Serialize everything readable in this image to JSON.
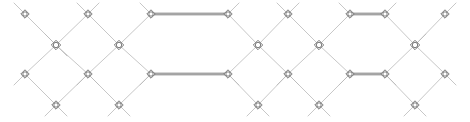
{
  "figure": {
    "title": "",
    "width": 470,
    "height": 122,
    "background_color": "#ffffff"
  },
  "style": {
    "diagonal_edge_color": "#b9b9b9",
    "diagonal_edge_width": 0.8,
    "horizontal_edge_color": "#6e6e6e",
    "horizontal_edge_width": 0.9,
    "horizontal_edge_gap": 1.6,
    "node_stroke_color": "#5a5a5a",
    "node_fill_color": "#ffffff",
    "node_stroke_width": 0.8,
    "small_node_radius": 3.1,
    "large_node_radius": 3.6
  },
  "rows": {
    "y_top": 14,
    "y_upper_mid": 45,
    "y_lower_mid": 74,
    "y_bottom": 105
  },
  "nodes": [
    {
      "id": "t0",
      "label": "",
      "row": "top",
      "x": 25,
      "y": 14,
      "size": "small",
      "shape": "diamond-circle"
    },
    {
      "id": "t1",
      "label": "",
      "row": "top",
      "x": 88,
      "y": 14,
      "size": "small",
      "shape": "diamond-circle"
    },
    {
      "id": "t2",
      "label": "",
      "row": "top",
      "x": 151,
      "y": 14,
      "size": "small",
      "shape": "diamond-circle"
    },
    {
      "id": "t3",
      "label": "",
      "row": "top",
      "x": 228,
      "y": 14,
      "size": "small",
      "shape": "diamond-circle"
    },
    {
      "id": "t4",
      "label": "",
      "row": "top",
      "x": 288,
      "y": 14,
      "size": "small",
      "shape": "diamond-circle"
    },
    {
      "id": "t5",
      "label": "",
      "row": "top",
      "x": 350,
      "y": 14,
      "size": "small",
      "shape": "diamond-circle"
    },
    {
      "id": "t6",
      "label": "",
      "row": "top",
      "x": 385,
      "y": 14,
      "size": "small",
      "shape": "diamond-circle"
    },
    {
      "id": "t7",
      "label": "",
      "row": "top",
      "x": 445,
      "y": 14,
      "size": "small",
      "shape": "diamond-circle"
    },
    {
      "id": "u0",
      "label": "",
      "row": "upper-mid",
      "x": 56,
      "y": 45,
      "size": "large",
      "shape": "diamond-circle"
    },
    {
      "id": "u1",
      "label": "",
      "row": "upper-mid",
      "x": 119,
      "y": 45,
      "size": "large",
      "shape": "diamond-circle"
    },
    {
      "id": "u2",
      "label": "",
      "row": "upper-mid",
      "x": 258,
      "y": 45,
      "size": "large",
      "shape": "diamond-circle"
    },
    {
      "id": "u3",
      "label": "",
      "row": "upper-mid",
      "x": 319,
      "y": 45,
      "size": "large",
      "shape": "diamond-circle"
    },
    {
      "id": "u4",
      "label": "",
      "row": "upper-mid",
      "x": 415,
      "y": 45,
      "size": "large",
      "shape": "diamond-circle"
    },
    {
      "id": "m0",
      "label": "",
      "row": "lower-mid",
      "x": 25,
      "y": 74,
      "size": "small",
      "shape": "diamond-circle"
    },
    {
      "id": "m1",
      "label": "",
      "row": "lower-mid",
      "x": 88,
      "y": 74,
      "size": "small",
      "shape": "diamond-circle"
    },
    {
      "id": "m2",
      "label": "",
      "row": "lower-mid",
      "x": 151,
      "y": 74,
      "size": "small",
      "shape": "diamond-circle"
    },
    {
      "id": "m3",
      "label": "",
      "row": "lower-mid",
      "x": 228,
      "y": 74,
      "size": "small",
      "shape": "diamond-circle"
    },
    {
      "id": "m4",
      "label": "",
      "row": "lower-mid",
      "x": 288,
      "y": 74,
      "size": "small",
      "shape": "diamond-circle"
    },
    {
      "id": "m5",
      "label": "",
      "row": "lower-mid",
      "x": 350,
      "y": 74,
      "size": "small",
      "shape": "diamond-circle"
    },
    {
      "id": "m6",
      "label": "",
      "row": "lower-mid",
      "x": 385,
      "y": 74,
      "size": "small",
      "shape": "diamond-circle"
    },
    {
      "id": "m7",
      "label": "",
      "row": "lower-mid",
      "x": 445,
      "y": 74,
      "size": "small",
      "shape": "diamond-circle"
    },
    {
      "id": "b0",
      "label": "",
      "row": "bottom",
      "x": 56,
      "y": 105,
      "size": "small",
      "shape": "diamond-circle"
    },
    {
      "id": "b1",
      "label": "",
      "row": "bottom",
      "x": 119,
      "y": 105,
      "size": "small",
      "shape": "diamond-circle"
    },
    {
      "id": "b2",
      "label": "",
      "row": "bottom",
      "x": 258,
      "y": 105,
      "size": "small",
      "shape": "diamond-circle"
    },
    {
      "id": "b3",
      "label": "",
      "row": "bottom",
      "x": 319,
      "y": 105,
      "size": "small",
      "shape": "diamond-circle"
    },
    {
      "id": "b4",
      "label": "",
      "row": "bottom",
      "x": 415,
      "y": 105,
      "size": "small",
      "shape": "diamond-circle"
    }
  ],
  "diagonal_edges": [
    {
      "from": "t0",
      "to": "u0"
    },
    {
      "from": "u0",
      "to": "t1"
    },
    {
      "from": "t1",
      "to": "u1"
    },
    {
      "from": "u1",
      "to": "t2"
    },
    {
      "from": "t3",
      "to": "u2"
    },
    {
      "from": "u2",
      "to": "t4"
    },
    {
      "from": "t4",
      "to": "u3"
    },
    {
      "from": "u3",
      "to": "t5"
    },
    {
      "from": "t6",
      "to": "u4"
    },
    {
      "from": "u4",
      "to": "t7"
    },
    {
      "from": "m0",
      "to": "u0"
    },
    {
      "from": "u0",
      "to": "m1"
    },
    {
      "from": "m1",
      "to": "u1"
    },
    {
      "from": "u1",
      "to": "m2"
    },
    {
      "from": "m3",
      "to": "u2"
    },
    {
      "from": "u2",
      "to": "m4"
    },
    {
      "from": "m4",
      "to": "u3"
    },
    {
      "from": "u3",
      "to": "m5"
    },
    {
      "from": "m6",
      "to": "u4"
    },
    {
      "from": "u4",
      "to": "m7"
    },
    {
      "from": "m0",
      "to": "b0"
    },
    {
      "from": "b0",
      "to": "m1"
    },
    {
      "from": "m1",
      "to": "b1"
    },
    {
      "from": "b1",
      "to": "m2"
    },
    {
      "from": "m3",
      "to": "b2"
    },
    {
      "from": "b2",
      "to": "m4"
    },
    {
      "from": "m4",
      "to": "b3"
    },
    {
      "from": "b3",
      "to": "m5"
    },
    {
      "from": "m6",
      "to": "b4"
    },
    {
      "from": "b4",
      "to": "m7"
    }
  ],
  "horizontal_edges": [
    {
      "id": "h-top-long",
      "from": "t2",
      "to": "t3",
      "style": "double"
    },
    {
      "id": "h-mid-long",
      "from": "m2",
      "to": "m3",
      "style": "double"
    },
    {
      "id": "h-top-short",
      "from": "t5",
      "to": "t6",
      "style": "double"
    },
    {
      "id": "h-mid-short",
      "from": "m5",
      "to": "m6",
      "style": "double"
    }
  ],
  "stub_edges": [
    {
      "id": "stub-left-top",
      "x1": 14,
      "y1": 3,
      "x2": 25,
      "y2": 14
    },
    {
      "id": "stub-left-mid",
      "x1": 14,
      "y1": 85,
      "x2": 25,
      "y2": 74
    },
    {
      "id": "stub-t1-left",
      "x1": 77,
      "y1": 3,
      "x2": 88,
      "y2": 14
    },
    {
      "id": "stub-t1-right",
      "x1": 99,
      "y1": 3,
      "x2": 88,
      "y2": 14
    },
    {
      "id": "stub-t2-left",
      "x1": 140,
      "y1": 3,
      "x2": 151,
      "y2": 14
    },
    {
      "id": "stub-t3-right",
      "x1": 239,
      "y1": 3,
      "x2": 228,
      "y2": 14
    },
    {
      "id": "stub-t4-left",
      "x1": 277,
      "y1": 3,
      "x2": 288,
      "y2": 14
    },
    {
      "id": "stub-t4-right",
      "x1": 299,
      "y1": 3,
      "x2": 288,
      "y2": 14
    },
    {
      "id": "stub-t5-left",
      "x1": 339,
      "y1": 3,
      "x2": 350,
      "y2": 14
    },
    {
      "id": "stub-t6-right",
      "x1": 396,
      "y1": 3,
      "x2": 385,
      "y2": 14
    },
    {
      "id": "stub-t7-right",
      "x1": 456,
      "y1": 3,
      "x2": 445,
      "y2": 14
    },
    {
      "id": "stub-m1-left",
      "x1": 77,
      "y1": 85,
      "x2": 88,
      "y2": 74
    },
    {
      "id": "stub-m1-right",
      "x1": 99,
      "y1": 85,
      "x2": 88,
      "y2": 74
    },
    {
      "id": "stub-m2-left",
      "x1": 140,
      "y1": 85,
      "x2": 151,
      "y2": 74
    },
    {
      "id": "stub-m3-right",
      "x1": 239,
      "y1": 85,
      "x2": 228,
      "y2": 74
    },
    {
      "id": "stub-m4-left",
      "x1": 277,
      "y1": 85,
      "x2": 288,
      "y2": 74
    },
    {
      "id": "stub-m4-right",
      "x1": 299,
      "y1": 85,
      "x2": 288,
      "y2": 74
    },
    {
      "id": "stub-m5-left",
      "x1": 339,
      "y1": 85,
      "x2": 350,
      "y2": 74
    },
    {
      "id": "stub-m6-right",
      "x1": 396,
      "y1": 85,
      "x2": 385,
      "y2": 74
    },
    {
      "id": "stub-m7-right",
      "x1": 456,
      "y1": 85,
      "x2": 445,
      "y2": 74
    },
    {
      "id": "stub-b0-left",
      "x1": 45,
      "y1": 116,
      "x2": 56,
      "y2": 105
    },
    {
      "id": "stub-b0-right",
      "x1": 67,
      "y1": 116,
      "x2": 56,
      "y2": 105
    },
    {
      "id": "stub-b1-left",
      "x1": 108,
      "y1": 116,
      "x2": 119,
      "y2": 105
    },
    {
      "id": "stub-b1-right",
      "x1": 130,
      "y1": 116,
      "x2": 119,
      "y2": 105
    },
    {
      "id": "stub-b2-left",
      "x1": 247,
      "y1": 116,
      "x2": 258,
      "y2": 105
    },
    {
      "id": "stub-b2-right",
      "x1": 269,
      "y1": 116,
      "x2": 258,
      "y2": 105
    },
    {
      "id": "stub-b3-left",
      "x1": 308,
      "y1": 116,
      "x2": 319,
      "y2": 105
    },
    {
      "id": "stub-b3-right",
      "x1": 330,
      "y1": 116,
      "x2": 319,
      "y2": 105
    },
    {
      "id": "stub-b4-left",
      "x1": 404,
      "y1": 116,
      "x2": 415,
      "y2": 105
    },
    {
      "id": "stub-b4-right",
      "x1": 426,
      "y1": 116,
      "x2": 415,
      "y2": 105
    },
    {
      "id": "stub-u0-left",
      "x1": 45,
      "y1": 34,
      "x2": 56,
      "y2": 45
    },
    {
      "id": "stub-u0-right",
      "x1": 67,
      "y1": 56,
      "x2": 56,
      "y2": 45
    },
    {
      "id": "stub-u4-right",
      "x1": 426,
      "y1": 34,
      "x2": 415,
      "y2": 45
    }
  ]
}
